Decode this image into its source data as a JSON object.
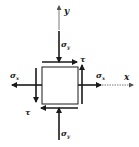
{
  "diagram": {
    "axes": {
      "x_label": "x",
      "y_label": "y"
    },
    "stresses": {
      "sigma_x_label": "σ",
      "sigma_x_sub": "x",
      "sigma_y_label": "σ",
      "sigma_y_sub": "y",
      "tau_label": "τ"
    },
    "colors": {
      "stroke": "#1a1a1a",
      "axis": "#555555",
      "background": "#ffffff"
    }
  }
}
